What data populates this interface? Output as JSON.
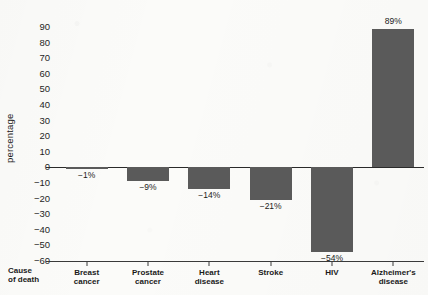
{
  "chart_data": {
    "type": "bar",
    "title": "",
    "xlabel": "Cause of death",
    "ylabel": "percentage",
    "categories": [
      "Breast cancer",
      "Prostate cancer",
      "Heart disease",
      "Stroke",
      "HIV",
      "Alzheimer's disease"
    ],
    "values": [
      -1,
      -9,
      -14,
      -21,
      -54,
      89
    ],
    "data_labels": [
      "−1%",
      "−9%",
      "−14%",
      "−21%",
      "−54%",
      "89%"
    ],
    "ylim": [
      -60,
      90
    ],
    "ytick_step": 10,
    "ytick_labels": [
      "90",
      "80",
      "70",
      "60",
      "50",
      "40",
      "30",
      "20",
      "10",
      "0",
      "−10",
      "−20",
      "−30",
      "−40",
      "−50",
      "−60"
    ],
    "ytick_values": [
      90,
      80,
      70,
      60,
      50,
      40,
      30,
      20,
      10,
      0,
      -10,
      -20,
      -30,
      -40,
      -50,
      -60
    ],
    "grid": false,
    "legend": false,
    "bar_color": "#5a5a5a",
    "axis_color": "#2a2a2a",
    "background_color": "#fbfbf9"
  },
  "axis": {
    "y_title": "percentage",
    "x_title": "Cause\nof death"
  }
}
